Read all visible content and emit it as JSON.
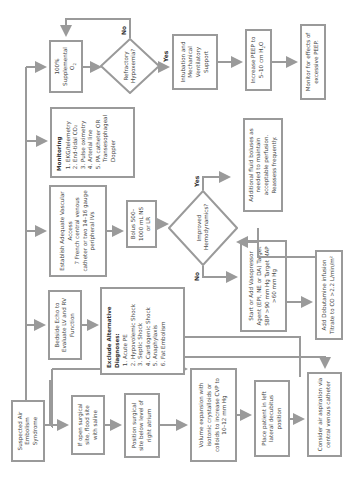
{
  "flowchart": {
    "start": "Suspected Air Embolism Syndrome",
    "boxes": {
      "open_site": "If open surgical site, flood site with saline",
      "position_site": "Position surgical site below level of right atrium",
      "volume": "Volume expansion with isotonic crystalloids or colloids to increase CVP to 10–12 mm Hg",
      "decubitus": "Place patient in left lateral decubitus position",
      "aspiration": "Consider air aspiration via central venous catheter",
      "echo": "Bedside Echo to Evaluate LV and RV Function",
      "access_title": "Establish Adequate Vascular Access",
      "access_body": "7 French central venous catheter or two 14–16 gauge peripheral IVs",
      "bolus": "Bolus 500–1000 mL NS or LR",
      "vasopressor": "Start or Add Vasopressor Agent (EPI, NE or DA) Target SBP >90 mm Hg Target MAP >60 mm Hg",
      "dobutamine": "Add Dobutamine infusion Titrate to CO >2.2 L/min/m²",
      "additional_fluid": "Additional fluid boluses as needed to maintain acceptable perfusion. Reassess frequently.",
      "oxygen_main": "100% Supplemental",
      "oxygen_sym": "O",
      "oxygen_sub": "2",
      "intubation": "Intubation and Mechanical Ventilatory Support",
      "peep_main": "Increase PEEP to 5–10 cm H",
      "peep_sub": "2",
      "peep_tail": "O",
      "monitor_peep": "Monitor for effects of excessive PEEP."
    },
    "exclude": {
      "title": "Exclude Alternative Diagnoses:",
      "items": [
        "Acute PE",
        "Hypovolemic Shock",
        "Septic Shock",
        "Cardiogenic Shock",
        "Anaphylaxis",
        "Fat Embolism"
      ]
    },
    "monitoring": {
      "title": "Monitoring",
      "items": [
        "EKG/telemetry",
        "End-tidal CO₂",
        "Pulse oximetry",
        "Arterial line",
        "PA catheter OR Transesophageal Doppler"
      ]
    },
    "decisions": {
      "hemodynamics": "Improved Hemodynamics?",
      "hypoxemia": "Refractory Hypoxemia?"
    },
    "labels": {
      "yes": "Yes",
      "no": "No"
    },
    "colors": {
      "line": "#9a9a9a",
      "text": "#444444"
    }
  }
}
